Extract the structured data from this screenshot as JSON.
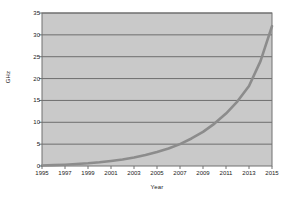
{
  "chart_data": {
    "type": "line",
    "title": "",
    "subtitle": "",
    "xlabel": "Year",
    "ylabel": "GHz",
    "xlim": [
      1995,
      2015
    ],
    "ylim": [
      0,
      35
    ],
    "xticks": [
      1995,
      1997,
      1999,
      2001,
      2003,
      2005,
      2007,
      2009,
      2011,
      2013,
      2015
    ],
    "yticks": [
      0,
      5,
      10,
      15,
      20,
      25,
      30,
      35
    ],
    "grid": "horizontal",
    "legend": "none",
    "series": [
      {
        "name": "GHz",
        "color": "#8c8c8c",
        "x": [
          1995,
          1996,
          1997,
          1998,
          1999,
          2000,
          2001,
          2002,
          2003,
          2004,
          2005,
          2006,
          2007,
          2008,
          2009,
          2010,
          2011,
          2012,
          2013,
          2014,
          2015
        ],
        "values": [
          0.12,
          0.2,
          0.3,
          0.45,
          0.62,
          0.85,
          1.15,
          1.5,
          1.95,
          2.5,
          3.2,
          4.0,
          5.0,
          6.3,
          7.8,
          9.7,
          12.0,
          14.8,
          18.3,
          24.0,
          32.0
        ]
      }
    ],
    "annotations": []
  },
  "style": {
    "plot_background": "#c9c9c9",
    "page_background": "#ffffff",
    "gridline_color": "#6e6e6e",
    "axis_color": "#707070",
    "line_color": "#8c8c8c",
    "tick_text_color": "#1a1a1a"
  }
}
